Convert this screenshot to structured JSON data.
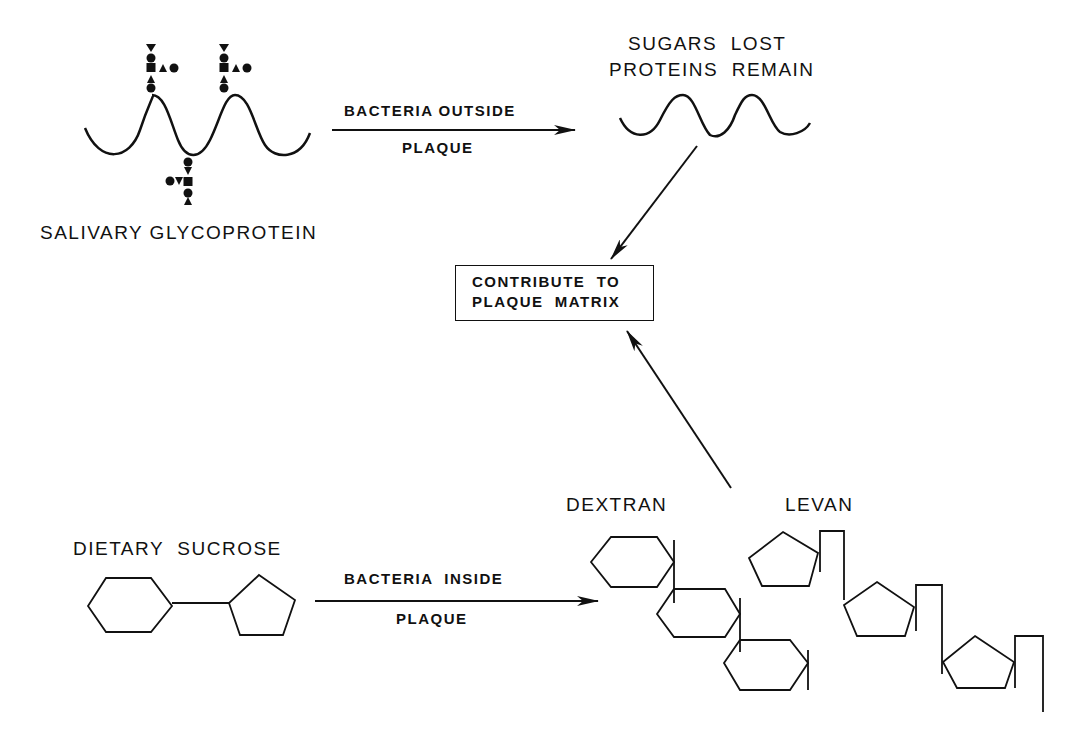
{
  "diagram": {
    "colors": {
      "ink": "#111111",
      "background": "#ffffff"
    },
    "top_left": {
      "label": "SALIVARY GLYCOPROTEIN"
    },
    "arrow_top": {
      "label_above": "BACTERIA OUTSIDE",
      "label_below": "PLAQUE"
    },
    "top_right": {
      "line1": "SUGARS  LOST",
      "line2": "PROTEINS  REMAIN"
    },
    "center_box": {
      "line1": "CONTRIBUTE  TO",
      "line2": "PLAQUE  MATRIX"
    },
    "bottom_left": {
      "label": "DIETARY  SUCROSE"
    },
    "arrow_bottom": {
      "label_above": "BACTERIA  INSIDE",
      "label_below": "PLAQUE"
    },
    "polymers": {
      "dextran_label": "DEXTRAN",
      "levan_label": "LEVAN"
    },
    "legend_symbols": [
      "triangle-down",
      "circle",
      "square",
      "triangle-up"
    ]
  }
}
